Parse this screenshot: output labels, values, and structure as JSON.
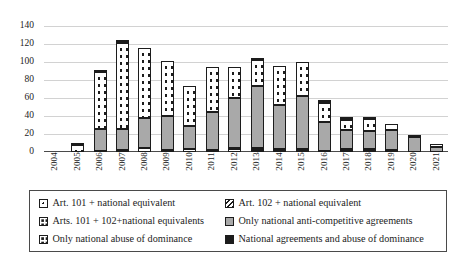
{
  "chart_data": {
    "type": "bar",
    "title": "",
    "xlabel": "",
    "ylabel": "",
    "ylim": [
      0,
      140
    ],
    "ytick_step": 20,
    "yticks": [
      0,
      20,
      40,
      60,
      80,
      100,
      120,
      140
    ],
    "grid": true,
    "stacked": true,
    "legend_position": "bottom",
    "categories": [
      "2004",
      "2005",
      "2006",
      "2007",
      "2008",
      "2009",
      "2010",
      "2011",
      "2012",
      "2013",
      "2014",
      "2015",
      "2016",
      "2017",
      "2018",
      "2019",
      "2020",
      "2021"
    ],
    "series": [
      {
        "name": "Art. 101 + national equivalent",
        "color": "#ffffff",
        "pattern": "fine-dot",
        "values": [
          0,
          0,
          1,
          2,
          5,
          2,
          3,
          1,
          3,
          2,
          1,
          1,
          0,
          2,
          1,
          1,
          0,
          0
        ]
      },
      {
        "name": "Art. 102 + national equivalent",
        "color": "#ffffff",
        "pattern": "diagonal-hatch",
        "values": [
          0,
          0,
          0,
          0,
          0,
          0,
          0,
          1,
          1,
          2,
          2,
          2,
          1,
          1,
          2,
          1,
          0,
          0
        ]
      },
      {
        "name": "Arts. 101 + 102+national equivalents",
        "color": "#ffffff",
        "pattern": "coarse-dot",
        "values": [
          0,
          0,
          0,
          0,
          0,
          0,
          0,
          0,
          0,
          0,
          0,
          0,
          0,
          0,
          0,
          0,
          0,
          0
        ]
      },
      {
        "name": "Only national anti-competitive agreements",
        "color": "#a9a9a9",
        "pattern": "solid-gray",
        "values": [
          0,
          0,
          25,
          24,
          33,
          38,
          26,
          43,
          56,
          69,
          49,
          59,
          32,
          22,
          20,
          22,
          17,
          6
        ]
      },
      {
        "name": "Only national abuse of dominance",
        "color": "#ffffff",
        "pattern": "coarse-dot",
        "values": [
          0,
          8,
          63,
          95,
          78,
          61,
          44,
          50,
          35,
          29,
          44,
          38,
          22,
          11,
          14,
          7,
          2,
          2
        ]
      },
      {
        "name": "National agreements  and abuse of dominance",
        "color": "#1c1c1c",
        "pattern": "solid-black",
        "values": [
          0,
          2,
          1,
          3,
          0,
          0,
          0,
          0,
          0,
          3,
          0,
          0,
          1,
          1,
          1,
          0,
          0,
          0
        ]
      }
    ],
    "totals": [
      0,
      10,
      90,
      124,
      116,
      101,
      73,
      95,
      95,
      105,
      96,
      100,
      56,
      37,
      38,
      31,
      19,
      8
    ]
  },
  "legend": {
    "entries": [
      {
        "label": "Art. 101 + national equivalent",
        "swatch": "sw-art101"
      },
      {
        "label": "Art. 102 + national equivalent",
        "swatch": "sw-art102"
      },
      {
        "label": "Arts. 101 + 102+national equivalents",
        "swatch": "sw-both"
      },
      {
        "label": "Only national anti-competitive agreements",
        "swatch": "sw-natagree"
      },
      {
        "label": "Only national abuse of dominance",
        "swatch": "sw-natabuse"
      },
      {
        "label": "National agreements  and abuse of dominance",
        "swatch": "sw-natboth"
      }
    ]
  }
}
